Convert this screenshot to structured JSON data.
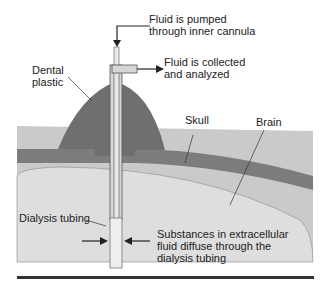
{
  "diagram": {
    "labels": {
      "pumped": "Fluid is pumped\nthrough inner cannula",
      "collected": "Fluid is collected\nand analyzed",
      "dental_plastic": "Dental\nplastic",
      "skull": "Skull",
      "brain": "Brain",
      "dialysis_tubing": "Dialysis tubing",
      "substances": "Substances in extracellular\nfluid diffuse through the\ndialysis tubing"
    },
    "colors": {
      "dental_plastic": "#6e6e6e",
      "skull": "#7a7a7a",
      "tissue": "#c8c8c8",
      "brain": "#dcdcdc",
      "tube": "#d8d8d8",
      "rule": "#333333"
    }
  }
}
